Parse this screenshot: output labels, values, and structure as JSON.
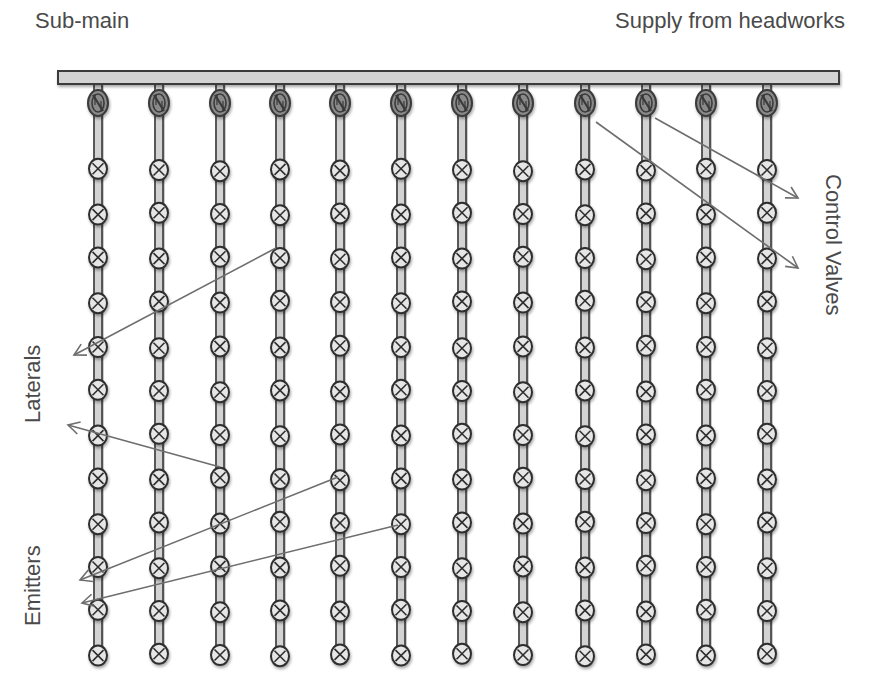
{
  "labels": {
    "sub_main": "Sub-main",
    "supply": "Supply from headworks",
    "laterals": "Laterals",
    "emitters": "Emitters",
    "control_valves": "Control Valves"
  },
  "colors": {
    "pipe_fill": "#d3d3d3",
    "pipe_stroke": "#3a3a3a",
    "emitter_stroke": "#2e2e2e",
    "valve_fill": "#8a8a8a",
    "arrow": "#6e6e6e",
    "text": "#4a4a4a"
  },
  "sub_main": {
    "x": 58,
    "y": 71,
    "width": 781,
    "height": 13
  },
  "laterals": {
    "count": 12,
    "x_positions": [
      98,
      159,
      220,
      280,
      340,
      401,
      462,
      523,
      585,
      646,
      706,
      767
    ],
    "valve_y": 103,
    "emitters_per_lateral": 12,
    "emitter_y_positions": [
      170,
      214,
      258,
      302,
      347,
      391,
      435,
      479,
      523,
      567,
      611,
      655
    ]
  },
  "arrows": [
    {
      "group": "laterals",
      "from": [
        276,
        248
      ],
      "to": [
        74,
        355
      ]
    },
    {
      "group": "laterals",
      "from": [
        220,
        467
      ],
      "to": [
        68,
        425
      ]
    },
    {
      "group": "emitters",
      "from": [
        338,
        477
      ],
      "to": [
        80,
        580
      ]
    },
    {
      "group": "emitters",
      "from": [
        398,
        525
      ],
      "to": [
        82,
        603
      ]
    },
    {
      "group": "control_valves",
      "from": [
        655,
        118
      ],
      "to": [
        798,
        198
      ]
    },
    {
      "group": "control_valves",
      "from": [
        596,
        122
      ],
      "to": [
        798,
        268
      ]
    }
  ]
}
